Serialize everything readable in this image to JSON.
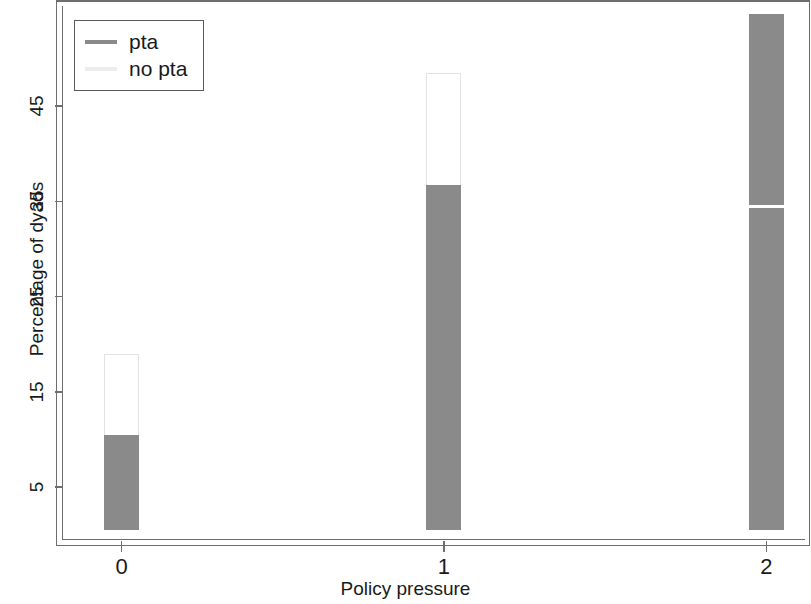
{
  "chart_data": {
    "type": "bar",
    "subtype": "stacked-bar",
    "title": "",
    "xlabel": "Policy pressure",
    "ylabel": "Percentage of dyads",
    "categories": [
      "0",
      "1",
      "2"
    ],
    "x": [
      0,
      1,
      2
    ],
    "series": [
      {
        "name": "pta",
        "values": [
          10.5,
          36.7,
          54.7
        ]
      },
      {
        "name": "no pta",
        "values": [
          8.5,
          11.8,
          0.0
        ]
      }
    ],
    "stack_totals": [
      19.0,
      48.5,
      54.7
    ],
    "xtick_labels": [
      "0",
      "1",
      "2"
    ],
    "ytick_labels": [
      "5",
      "15",
      "25",
      "35",
      "45"
    ],
    "ytick_values": [
      5,
      15,
      25,
      35,
      45
    ],
    "ylim": [
      0.5,
      55.5
    ],
    "xlim": [
      -0.18,
      2.12
    ],
    "grid": false,
    "legend_position": "top-left",
    "colors": {
      "pta": "#8a8a8a",
      "no_pta": "#ffffff",
      "frame": "#6e6e6e",
      "text": "#1a1a1a"
    }
  },
  "legend": {
    "entries": [
      {
        "label": "pta",
        "key": "legend-key-pta"
      },
      {
        "label": "no pta",
        "key": "legend-key-no-pta"
      }
    ]
  },
  "axes": {
    "y_title": "Percentage of dyads",
    "x_title": "Policy pressure"
  }
}
